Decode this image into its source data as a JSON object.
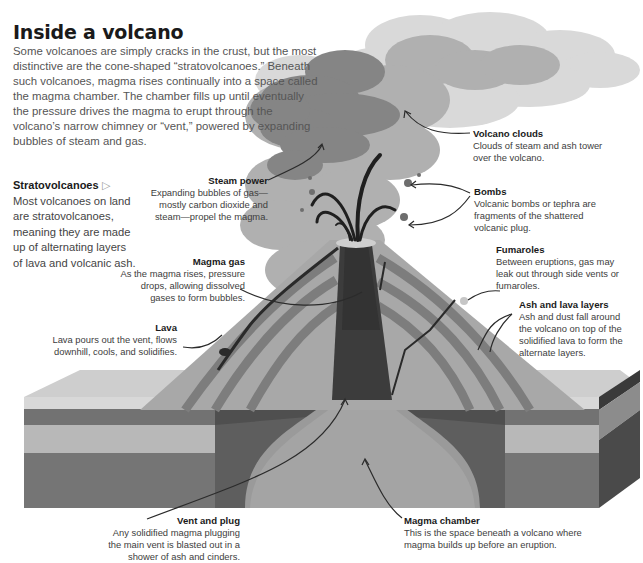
{
  "header": {
    "title": "Inside a volcano",
    "intro": "Some volcanoes are simply cracks in the crust, but the most distinctive are the cone-shaped “stratovolcanoes.” Beneath such volcanoes, magma rises continually into a space called the magma chamber. The chamber fills up until eventually the pressure drives the magma to erupt through the volcano’s narrow chimney or “vent,” powered by expanding bubbles of steam and gas."
  },
  "sidebar": {
    "heading": "Stratovolcanoes",
    "marker": "▷",
    "text": "Most volcanoes on land are stratovolcanoes, meaning they are made up of alternating layers of lava and volcanic ash."
  },
  "labels": {
    "steam_power": {
      "title": "Steam power",
      "text": "Expanding bubbles of gas— mostly carbon dioxide and steam—propel the magma."
    },
    "volcano_clouds": {
      "title": "Volcano clouds",
      "text": "Clouds of steam and ash tower over the volcano."
    },
    "bombs": {
      "title": "Bombs",
      "text": "Volcanic bombs or tephra are fragments of the shattered volcanic plug."
    },
    "fumaroles": {
      "title": "Fumaroles",
      "text": "Between eruptions, gas may leak out through side vents or fumaroles."
    },
    "magma_gas": {
      "title": "Magma gas",
      "text": "As the magma rises, pressure drops, allowing dissolved gases to form bubbles."
    },
    "lava": {
      "title": "Lava",
      "text": "Lava pours out the vent, flows downhill, cools, and solidifies."
    },
    "ash_lava_layers": {
      "title": "Ash and lava layers",
      "text": "Ash and dust fall around the volcano on top of the solidified lava to form the alternate layers."
    },
    "vent_plug": {
      "title": "Vent and plug",
      "text": "Any solidified magma plugging the main vent is blasted out in a shower of ash and cinders."
    },
    "magma_chamber": {
      "title": "Magma chamber",
      "text": "This is the space beneath a volcano where magma builds up before an eruption."
    }
  },
  "colors": {
    "cloud_light": "#d6d6d6",
    "cloud_mid": "#a8a8a8",
    "cloud_dark": "#7c7c7c",
    "cone": "#a9a9a9",
    "cone_band": "#838383",
    "vent": "#3f3f3f",
    "ground_top": "#cfcfcf",
    "strata_dark": "#6e6e6e",
    "strata_light": "#b5b5b5",
    "chamber": "#989898",
    "side_face": "#4a4a4a"
  }
}
